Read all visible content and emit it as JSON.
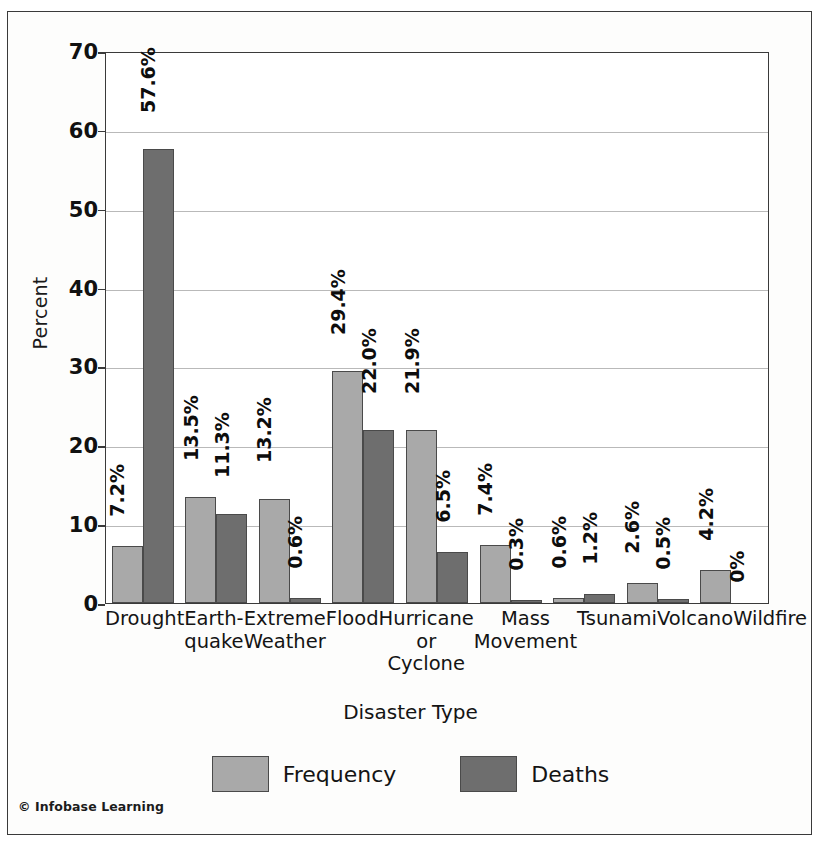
{
  "figure": {
    "copyright": "© Infobase Learning"
  },
  "chart_data": {
    "type": "bar",
    "title": "",
    "xlabel": "Disaster Type",
    "ylabel": "Percent",
    "ylim": [
      0,
      70
    ],
    "yticks": [
      0,
      10,
      20,
      30,
      40,
      50,
      60,
      70
    ],
    "grid": true,
    "legend_position": "bottom",
    "categories": [
      "Drought",
      "Earthquake",
      "Extreme Weather",
      "Flood",
      "Hurricane or Cyclone",
      "Mass Movement",
      "Tsunami",
      "Volcano",
      "Wildfire"
    ],
    "category_label_lines": [
      [
        "Drought"
      ],
      [
        "Earth-",
        "quake"
      ],
      [
        "Extreme",
        "Weather"
      ],
      [
        "Flood"
      ],
      [
        "Hurricane",
        "or",
        "Cyclone"
      ],
      [
        "Mass",
        "Movement"
      ],
      [
        "Tsunami"
      ],
      [
        "Volcano"
      ],
      [
        "Wildfire"
      ]
    ],
    "series": [
      {
        "name": "Frequency",
        "color": "#a9a9a9",
        "values": [
          7.2,
          13.5,
          13.2,
          29.4,
          21.9,
          7.4,
          0.6,
          2.6,
          4.2
        ],
        "labels": [
          "7.2%",
          "13.5%",
          "13.2%",
          "29.4%",
          "21.9%",
          "7.4%",
          "0.6%",
          "2.6%",
          "4.2%"
        ]
      },
      {
        "name": "Deaths",
        "color": "#6e6e6e",
        "values": [
          57.6,
          11.3,
          0.6,
          22.0,
          6.5,
          0.3,
          1.2,
          0.5,
          0
        ],
        "labels": [
          "57.6%",
          "11.3%",
          "0.6%",
          "22.0%",
          "6.5%",
          "0.3%",
          "1.2%",
          "0.5%",
          "0%"
        ]
      }
    ]
  }
}
